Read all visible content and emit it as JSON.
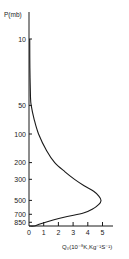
{
  "chart_data": {
    "type": "line",
    "title": "",
    "ylabel": "P(mb)",
    "xlabel": "Q₀(10⁻⁸K,Kg⁻¹S⁻¹)",
    "y_scale": "log",
    "y_inverted": true,
    "ylim": [
      10,
      1000
    ],
    "xlim": [
      0,
      5.7
    ],
    "grid": false,
    "legend": null,
    "y_ticks": [
      10,
      50,
      100,
      200,
      300,
      500,
      700,
      850
    ],
    "y_tick_labels": [
      "10",
      "50",
      "100",
      "200",
      "300",
      "500",
      "700",
      "850"
    ],
    "x_ticks": [
      0,
      1,
      2,
      3,
      4,
      5
    ],
    "x_tick_labels": [
      "0",
      "1",
      "2",
      "3",
      "4",
      "5"
    ],
    "series": [
      {
        "name": "Q0 profile",
        "points": [
          {
            "p": 10,
            "q": 0.05
          },
          {
            "p": 20,
            "q": 0.06
          },
          {
            "p": 40,
            "q": 0.1
          },
          {
            "p": 50,
            "q": 0.15
          },
          {
            "p": 70,
            "q": 0.35
          },
          {
            "p": 100,
            "q": 0.65
          },
          {
            "p": 150,
            "q": 1.2
          },
          {
            "p": 200,
            "q": 1.75
          },
          {
            "p": 250,
            "q": 2.45
          },
          {
            "p": 300,
            "q": 3.1
          },
          {
            "p": 350,
            "q": 3.75
          },
          {
            "p": 400,
            "q": 4.4
          },
          {
            "p": 450,
            "q": 4.75
          },
          {
            "p": 500,
            "q": 4.9
          },
          {
            "p": 550,
            "q": 4.75
          },
          {
            "p": 620,
            "q": 4.3
          },
          {
            "p": 680,
            "q": 3.7
          },
          {
            "p": 740,
            "q": 2.6
          },
          {
            "p": 800,
            "q": 1.7
          },
          {
            "p": 880,
            "q": 0.8
          },
          {
            "p": 950,
            "q": 0.35
          },
          {
            "p": 1000,
            "q": 0.0
          }
        ]
      }
    ]
  },
  "labels": {
    "ylabel": "P(mb)",
    "xlabel": "Q₀(10⁻⁸K,Kg⁻¹S⁻¹)"
  }
}
